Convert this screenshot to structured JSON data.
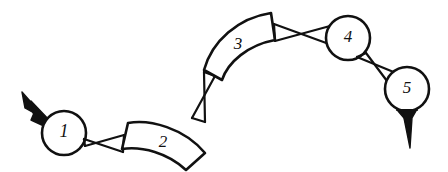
{
  "figure": {
    "kind": "kinematic-chain-sketch",
    "background_color": "#ffffff",
    "ink_color": "#111111",
    "width": 448,
    "height": 172
  },
  "members": [
    {
      "id": "member-1",
      "label": "1",
      "shape": "circle",
      "center_x": 64,
      "center_y": 133,
      "radius": 22
    },
    {
      "id": "member-2",
      "label": "2",
      "shape": "curved-bar",
      "center_x": 164,
      "center_y": 141
    },
    {
      "id": "member-3",
      "label": "3",
      "shape": "curved-bar",
      "center_x": 238,
      "center_y": 43
    },
    {
      "id": "member-4",
      "label": "4",
      "shape": "circle",
      "center_x": 348,
      "center_y": 38,
      "radius": 22
    },
    {
      "id": "member-5",
      "label": "5",
      "shape": "circle",
      "center_x": 407,
      "center_y": 89,
      "radius": 22
    }
  ],
  "joints": [
    {
      "id": "joint-1-2",
      "style": "bowtie",
      "from": "1",
      "to": "2"
    },
    {
      "id": "joint-2-3",
      "style": "bowtie",
      "from": "2",
      "to": "3"
    },
    {
      "id": "joint-3-4",
      "style": "bowtie",
      "from": "3",
      "to": "4"
    },
    {
      "id": "joint-4-5",
      "style": "bowtie",
      "from": "4",
      "to": "5"
    }
  ],
  "arrows": [
    {
      "id": "arrow-input",
      "attached_to": "1",
      "direction": "up-left",
      "heads": 2
    },
    {
      "id": "arrow-output",
      "attached_to": "5",
      "direction": "down",
      "heads": 2
    }
  ]
}
